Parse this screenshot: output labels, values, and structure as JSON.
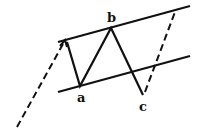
{
  "diagram": {
    "type": "zigzag-channel",
    "labels": {
      "a": "a",
      "b": "b",
      "c": "c"
    },
    "colors": {
      "line": "#111111",
      "background": "#ffffff"
    },
    "points": {
      "start": [
        65,
        40
      ],
      "a": [
        80,
        86
      ],
      "b": [
        111,
        28
      ],
      "c": [
        143,
        95
      ]
    },
    "channel": {
      "upper": [
        [
          58,
          42
        ],
        [
          190,
          6
        ]
      ],
      "lower": [
        [
          58,
          92
        ],
        [
          190,
          56
        ]
      ]
    },
    "dashed": {
      "incoming": [
        [
          17,
          127
        ],
        [
          65,
          40
        ]
      ],
      "outgoing": [
        [
          145,
          92
        ],
        [
          175,
          12
        ]
      ]
    }
  }
}
